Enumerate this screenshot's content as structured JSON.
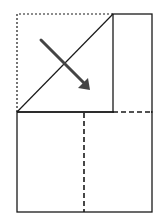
{
  "diagram": {
    "type": "origami-fold-step",
    "background": "#ffffff",
    "line_color": "#1a1a1a",
    "arrow_color": "#444444",
    "elements": {
      "dotted_outline": {
        "points": [
          [
            17,
            112
          ],
          [
            17,
            14
          ],
          [
            113,
            14
          ]
        ],
        "style": "dotted"
      },
      "fold_diagonal": {
        "from": [
          17,
          112
        ],
        "to": [
          113,
          14
        ],
        "style": "solid"
      },
      "right_flap": {
        "x": 113,
        "y": 14,
        "w": 39,
        "h": 98,
        "style": "solid"
      },
      "middle_line_solid": {
        "from": [
          17,
          112
        ],
        "to": [
          113,
          112
        ]
      },
      "middle_line_dashed": {
        "from": [
          113,
          112
        ],
        "to": [
          152,
          112
        ],
        "style": "valley-fold"
      },
      "bottom_panel": {
        "x": 17,
        "y": 112,
        "w": 135,
        "h": 100,
        "style": "solid"
      },
      "center_crease": {
        "from": [
          84,
          112
        ],
        "to": [
          84,
          212
        ],
        "style": "valley-fold"
      },
      "fold_arrow": {
        "from": [
          41,
          40
        ],
        "to": [
          90,
          89
        ],
        "direction": "down-right"
      }
    }
  }
}
